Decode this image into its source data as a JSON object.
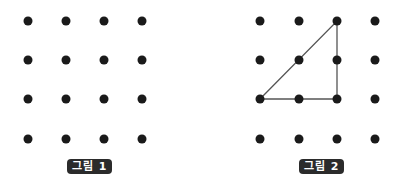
{
  "figures": [
    {
      "label": "그림 1",
      "grid": {
        "cols": 4,
        "rows": 4
      },
      "dots_x": [
        28,
        66,
        104,
        142
      ],
      "dots_y": [
        21,
        60,
        99,
        139
      ],
      "shape": null
    },
    {
      "label": "그림 2",
      "grid": {
        "cols": 4,
        "rows": 4
      },
      "dots_x": [
        260,
        299,
        337,
        375
      ],
      "dots_y": [
        21,
        60,
        99,
        139
      ],
      "shape": {
        "type": "right-triangle",
        "vertices_grid": [
          [
            0,
            2
          ],
          [
            2,
            0
          ],
          [
            2,
            2
          ]
        ]
      }
    }
  ],
  "colors": {
    "dot": "#1a1a1a",
    "line": "#555555",
    "label_bg": "#2b2b2b",
    "label_fg": "#ffffff"
  }
}
